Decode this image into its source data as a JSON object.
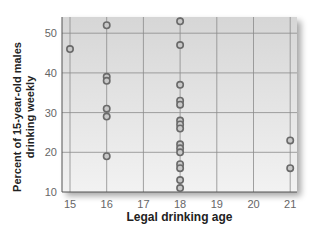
{
  "chart_data": {
    "type": "scatter",
    "title": "",
    "xlabel": "Legal drinking age",
    "ylabel": "Percent of 15-year-old males drinking weekly",
    "ylabel_lines": [
      "Percent of 15-year-old males",
      "drinking weekly"
    ],
    "xlim": [
      15,
      21
    ],
    "ylim": [
      10,
      53
    ],
    "xticks": [
      15,
      16,
      17,
      18,
      19,
      20,
      21
    ],
    "yticks": [
      10,
      20,
      30,
      40,
      50
    ],
    "grid": true,
    "legend": null,
    "points": [
      {
        "x": 15,
        "y": 46
      },
      {
        "x": 16,
        "y": 52
      },
      {
        "x": 16,
        "y": 39
      },
      {
        "x": 16,
        "y": 38
      },
      {
        "x": 16,
        "y": 31
      },
      {
        "x": 16,
        "y": 29
      },
      {
        "x": 16,
        "y": 19
      },
      {
        "x": 18,
        "y": 53
      },
      {
        "x": 18,
        "y": 47
      },
      {
        "x": 18,
        "y": 37
      },
      {
        "x": 18,
        "y": 33
      },
      {
        "x": 18,
        "y": 32
      },
      {
        "x": 18,
        "y": 28
      },
      {
        "x": 18,
        "y": 27
      },
      {
        "x": 18,
        "y": 26
      },
      {
        "x": 18,
        "y": 22
      },
      {
        "x": 18,
        "y": 21
      },
      {
        "x": 18,
        "y": 20
      },
      {
        "x": 18,
        "y": 17
      },
      {
        "x": 18,
        "y": 16
      },
      {
        "x": 18,
        "y": 13
      },
      {
        "x": 18,
        "y": 11
      },
      {
        "x": 21,
        "y": 23
      },
      {
        "x": 21,
        "y": 16
      }
    ],
    "colors": {
      "plot_bg_top": "#d6d6d6",
      "plot_bg_bottom": "#f2f2f2",
      "grid": "#8a8a8a",
      "marker_stroke": "#6a6a6a",
      "marker_fill": "#c8c8c8",
      "tick_text": "#666666"
    }
  }
}
